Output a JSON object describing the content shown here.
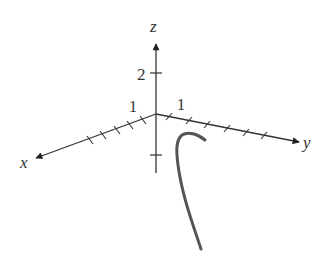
{
  "diagram": {
    "type": "3d-axes-with-curve",
    "axes": {
      "x": {
        "label": "x",
        "tick_label": "1",
        "tick_count": 5
      },
      "y": {
        "label": "y",
        "tick_label": "1",
        "tick_count": 6
      },
      "z": {
        "label": "z",
        "tick_label": "2",
        "tick_count": 2
      }
    },
    "colors": {
      "axis": "#333333",
      "curve": "#555555",
      "background": "#ffffff"
    }
  }
}
